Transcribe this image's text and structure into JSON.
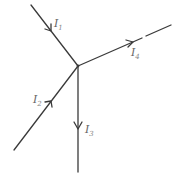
{
  "diagram": {
    "node": "junction",
    "currents": [
      {
        "id": "I1",
        "symbol": "I",
        "subscript": "1",
        "direction": "into-junction",
        "from": "upper-left"
      },
      {
        "id": "I2",
        "symbol": "I",
        "subscript": "2",
        "direction": "into-junction",
        "from": "lower-left"
      },
      {
        "id": "I3",
        "symbol": "I",
        "subscript": "3",
        "direction": "out-of-junction",
        "to": "down"
      },
      {
        "id": "I4",
        "symbol": "I",
        "subscript": "4",
        "direction": "out-of-junction",
        "to": "upper-right"
      }
    ],
    "colors": {
      "wire": "#3a3a3a",
      "label": "#666666"
    }
  }
}
